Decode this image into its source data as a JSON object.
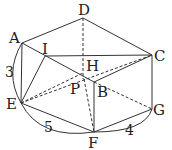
{
  "figure": {
    "type": "geometry-solid",
    "points": {
      "A": {
        "label": "A",
        "x": 22,
        "y": 43
      },
      "D": {
        "label": "D",
        "x": 83,
        "y": 18
      },
      "C": {
        "label": "C",
        "x": 152,
        "y": 55
      },
      "I": {
        "label": "I",
        "x": 45,
        "y": 56
      },
      "H": {
        "label": "H",
        "x": 83,
        "y": 73
      },
      "P": {
        "label": "P",
        "x": 84,
        "y": 79
      },
      "B": {
        "label": "B",
        "x": 94,
        "y": 82
      },
      "E": {
        "label": "E",
        "x": 21,
        "y": 103
      },
      "F": {
        "label": "F",
        "x": 94,
        "y": 132
      },
      "G": {
        "label": "G",
        "x": 152,
        "y": 109
      }
    },
    "dimensions": [
      {
        "between": "A-E",
        "value": "3"
      },
      {
        "between": "E-F",
        "value": "5"
      },
      {
        "between": "F-G",
        "value": "4"
      }
    ]
  }
}
